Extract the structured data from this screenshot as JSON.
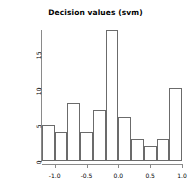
{
  "chart_data": {
    "type": "bar",
    "title": "Decision values (svm)",
    "xlabel": "",
    "ylabel": "Decision values",
    "bin_edges": [
      -1.2,
      -1.0,
      -0.8,
      -0.6,
      -0.4,
      -0.2,
      0.0,
      0.2,
      0.4,
      0.6,
      0.8,
      1.0
    ],
    "bin_centers": [
      -1.1,
      -0.9,
      -0.7,
      -0.5,
      -0.3,
      -0.1,
      0.1,
      0.3,
      0.5,
      0.7,
      0.9
    ],
    "values": [
      5,
      4,
      8,
      4,
      7,
      18,
      6,
      3,
      2,
      3,
      10
    ],
    "xlim": [
      -1.2,
      1.0
    ],
    "ylim": [
      0,
      18
    ],
    "xticks": [
      -1.0,
      -0.5,
      0.0,
      0.5,
      1.0
    ],
    "xtick_labels": [
      "-1.0",
      "-0.5",
      "0.0",
      "0.5",
      "1.0"
    ],
    "yticks": [
      0,
      5,
      10,
      15
    ],
    "ytick_labels": [
      "0",
      "5",
      "10",
      "15"
    ],
    "grid": false,
    "legend": null,
    "bar_border_color": "#6b6b6b",
    "bar_fill_color": "transparent",
    "axis_color": "#8a8a8a"
  }
}
